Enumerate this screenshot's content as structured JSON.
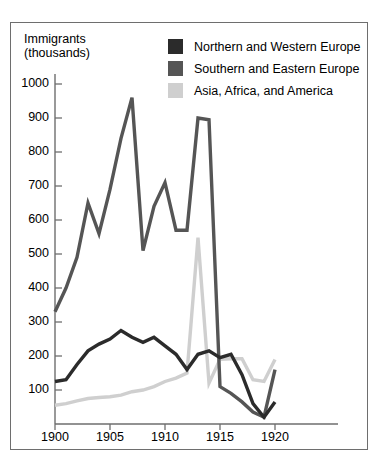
{
  "chart_data": {
    "type": "line",
    "title": "",
    "ylabel": "Immigrants\n(thousands)",
    "ylabel_line1": "Immigrants",
    "ylabel_line2": "(thousands)",
    "xlabel": "",
    "xlim": [
      1900,
      1921
    ],
    "ylim": [
      0,
      1050
    ],
    "yticks": [
      100,
      200,
      300,
      400,
      500,
      600,
      700,
      800,
      900,
      1000
    ],
    "xticks": [
      1900,
      1905,
      1910,
      1915,
      1920
    ],
    "grid": false,
    "legend_position": "top-right",
    "x": [
      1900,
      1901,
      1902,
      1903,
      1904,
      1905,
      1906,
      1907,
      1908,
      1909,
      1910,
      1911,
      1912,
      1913,
      1914,
      1915,
      1916,
      1917,
      1918,
      1919,
      1920
    ],
    "series": [
      {
        "name": "Northern and Western Europe",
        "color": "#2b2b2b",
        "values": [
          125,
          130,
          175,
          215,
          235,
          250,
          275,
          255,
          240,
          255,
          230,
          205,
          160,
          205,
          215,
          195,
          205,
          145,
          60,
          20,
          65
        ]
      },
      {
        "name": "Southern and Eastern Europe",
        "color": "#555555",
        "values": [
          330,
          400,
          490,
          650,
          560,
          690,
          840,
          960,
          510,
          640,
          710,
          570,
          570,
          900,
          895,
          110,
          90,
          65,
          35,
          20,
          160
        ]
      },
      {
        "name": "Asia, Africa, and America",
        "color": "#cfcfcf",
        "values": [
          55,
          60,
          68,
          75,
          78,
          80,
          85,
          95,
          100,
          110,
          125,
          135,
          150,
          548,
          120,
          190,
          192,
          192,
          130,
          125,
          190
        ]
      }
    ]
  },
  "legend": {
    "items": [
      {
        "label": "Northern and Western Europe",
        "color": "#2b2b2b"
      },
      {
        "label": "Southern and Eastern Europe",
        "color": "#555555"
      },
      {
        "label": "Asia, Africa, and America",
        "color": "#cfcfcf"
      }
    ]
  },
  "axes": {
    "y_title_line1": "Immigrants",
    "y_title_line2": "(thousands)",
    "y_ticks": [
      "1000",
      "900",
      "800",
      "700",
      "600",
      "500",
      "400",
      "300",
      "200",
      "100"
    ],
    "x_ticks": [
      "1900",
      "1905",
      "1910",
      "1915",
      "1920"
    ]
  }
}
